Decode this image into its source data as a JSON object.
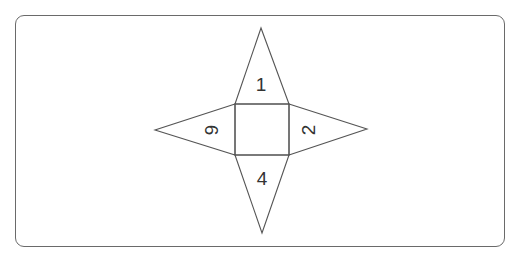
{
  "diagram": {
    "type": "net of square pyramid",
    "center_square": {
      "label": ""
    },
    "faces": [
      {
        "position": "top",
        "label": "1",
        "rotation": 0
      },
      {
        "position": "right",
        "label": "2",
        "rotation": -90
      },
      {
        "position": "bottom",
        "label": "4",
        "rotation": 0
      },
      {
        "position": "left",
        "label": "6",
        "rotation": 90
      }
    ],
    "colors": {
      "stroke": "#555555",
      "text": "#333333",
      "frame": "#6a6a6a"
    }
  }
}
